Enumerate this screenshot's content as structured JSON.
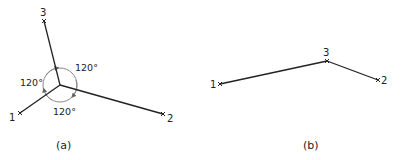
{
  "diagram_a": {
    "caption": "(a)",
    "nodes": [
      {
        "id": "1",
        "label": "1"
      },
      {
        "id": "2",
        "label": "2"
      },
      {
        "id": "3",
        "label": "3"
      }
    ],
    "angles": [
      "120°",
      "120°",
      "120°"
    ]
  },
  "diagram_b": {
    "caption": "(b)",
    "nodes": [
      {
        "id": "1",
        "label": "1"
      },
      {
        "id": "2",
        "label": "2"
      },
      {
        "id": "3",
        "label": "3"
      }
    ]
  },
  "colors": {
    "line": "#222222",
    "circle": "#888888",
    "background": "#ffffff"
  }
}
